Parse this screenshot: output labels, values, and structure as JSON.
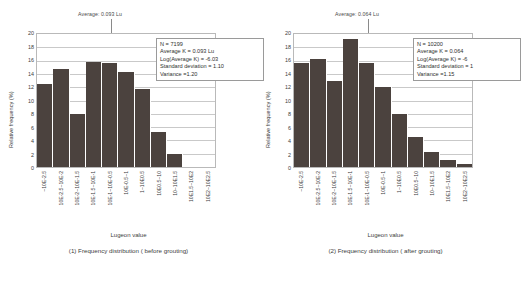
{
  "figure": {
    "panels": [
      {
        "id": "before-grouting",
        "caption": "(1) Frequency distribution ( before grouting)",
        "average_note": "Average: 0.093 Lu",
        "stats": {
          "n": "N = 7199",
          "average_k": "Average K = 0.093 Lu",
          "log_average_k": "Log(Average K) = -6.03",
          "standard_deviation": "Standard deviation = 1.10",
          "variance": "Variance =1.20"
        }
      },
      {
        "id": "after-grouting",
        "caption": "(2) Frequency distribution ( after grouting)",
        "average_note": "Average: 0.064 Lu",
        "stats": {
          "n": "N = 10200",
          "average_k": "Average K = 0.064",
          "log_average_k": "Log(Average K) = -6",
          "standard_deviation": "Standard deviation = 1",
          "variance": "Variance =1.15"
        }
      }
    ]
  },
  "chart_data": [
    {
      "type": "bar",
      "title": "(1) Frequency distribution ( before grouting)",
      "xlabel": "Lugeon value",
      "ylabel": "Relative frequency (%)",
      "ylim": [
        0,
        20
      ],
      "yticks": [
        0,
        2,
        4,
        6,
        8,
        10,
        12,
        14,
        16,
        18,
        20
      ],
      "grid": true,
      "legend": "none",
      "categories": [
        "~10E-2.5",
        "10E-2.5~10E-2",
        "10E-2~10E-1.5",
        "10E-1.5~10E-1",
        "10E-1~10E-0.5",
        "10E-0.5~1",
        "1~10E0.5",
        "10E0.5~10",
        "10~10E1.5",
        "10E1.5~10E2",
        "10E2~10E2.5"
      ],
      "values": [
        12.5,
        14.7,
        8.0,
        15.8,
        15.7,
        14.3,
        11.8,
        5.3,
        2.0,
        0.0,
        0.0
      ],
      "annotations": [
        {
          "text": "Average: 0.093 Lu",
          "at_category_index": 4,
          "kind": "vertical-line-label"
        }
      ],
      "textbox": [
        "N = 7199",
        "Average K = 0.093 Lu",
        "Log(Average K) = -6.03",
        "Standard deviation = 1.10",
        "Variance =1.20"
      ]
    },
    {
      "type": "bar",
      "title": "(2) Frequency distribution ( after grouting)",
      "xlabel": "Lugeon value",
      "ylabel": "Relative frequency (%)",
      "ylim": [
        0,
        20
      ],
      "yticks": [
        0,
        2,
        4,
        6,
        8,
        10,
        12,
        14,
        16,
        18,
        20
      ],
      "grid": true,
      "legend": "none",
      "categories": [
        "~10E-2.5",
        "10E-2.5~10E-2",
        "10E-2~10E-1.5",
        "10E-1.5~10E-1",
        "10E-1~10E-0.5",
        "10E-0.5~1",
        "1~10E0.5",
        "10E0.5~10",
        "10~10E1.5",
        "10E1.5~10E2",
        "10E2~10E2.5"
      ],
      "values": [
        15.7,
        16.2,
        12.9,
        19.3,
        15.7,
        12.1,
        8.0,
        4.5,
        2.3,
        1.0,
        0.5
      ],
      "annotations": [
        {
          "text": "Average: 0.064 Lu",
          "at_category_index": 4,
          "kind": "vertical-line-label"
        }
      ],
      "textbox": [
        "N = 10200",
        "Average K = 0.064",
        "Log(Average K) = -6",
        "Standard deviation = 1",
        "Variance =1.15"
      ]
    }
  ]
}
